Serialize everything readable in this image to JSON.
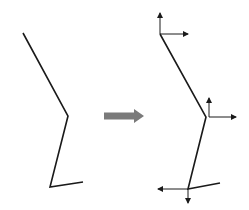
{
  "diagram": {
    "colors": {
      "background": "#ffffff",
      "line": "#1a1a1a",
      "transform_arrow": "#7a7a7a"
    },
    "left_chain": {
      "points": [
        [
          23,
          33
        ],
        [
          68,
          116
        ],
        [
          50,
          187
        ],
        [
          83,
          182
        ]
      ]
    },
    "transform_arrow": {
      "from": [
        104,
        116
      ],
      "to": [
        144,
        116
      ],
      "label": ""
    },
    "right_chain": {
      "points": [
        [
          160,
          34
        ],
        [
          206,
          117
        ],
        [
          188,
          189
        ],
        [
          220,
          183
        ]
      ],
      "frames": [
        {
          "name": "frame-top",
          "origin": [
            160,
            34
          ],
          "axes": [
            {
              "dir": "up",
              "tip": [
                160,
                13
              ]
            },
            {
              "dir": "right",
              "tip": [
                188,
                34
              ]
            }
          ]
        },
        {
          "name": "frame-middle",
          "origin": [
            209,
            117
          ],
          "axes": [
            {
              "dir": "up",
              "tip": [
                209,
                98
              ]
            },
            {
              "dir": "right",
              "tip": [
                236,
                117
              ]
            }
          ]
        },
        {
          "name": "frame-bottom",
          "origin": [
            188,
            189
          ],
          "axes": [
            {
              "dir": "left",
              "tip": [
                158,
                189
              ]
            },
            {
              "dir": "down",
              "tip": [
                188,
                203
              ]
            }
          ]
        }
      ]
    }
  }
}
